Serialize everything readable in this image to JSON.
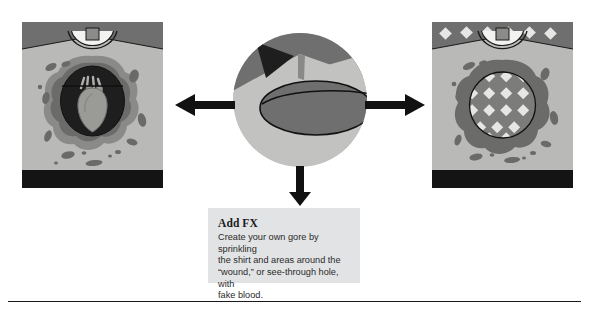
{
  "page": {
    "background_color": "#ffffff",
    "width": 589,
    "height": 311
  },
  "colors": {
    "shirt_body": "#b9bab8",
    "shoulder_band": "#6e6f6e",
    "collar_line": "#1a1a1a",
    "collar_white": "#f2f2f0",
    "hem_band": "#141414",
    "blood_outer": "#8a8b88",
    "blood_mid": "#6b6c69",
    "wound_dark": "#1e1e1e",
    "heart": "#9a9b97",
    "splatter": "#6a6b68",
    "diamond": "#e6e7e4",
    "hole_fill": "#7c7d7a",
    "caption_bg": "#e2e3e4",
    "arrow": "#111111",
    "rule": "#1a1a1a",
    "detail_circle_light": "#c2c3c1",
    "detail_circle_mid": "#8a8b88",
    "detail_circle_dark": "#6e6f6e",
    "detail_circle_black": "#1e1e1e"
  },
  "panels": {
    "left": {
      "name": "gore-wound-shirt",
      "description": "T-shirt with torn gore wound revealing a heart"
    },
    "right": {
      "name": "see-through-hole-shirt",
      "description": "T-shirt with see-through hole revealing diamond pattern fabric"
    }
  },
  "center": {
    "name": "magnified-detail",
    "description": "Magnified circular detail of the shirt wound"
  },
  "arrows": {
    "left": "arrow-left",
    "right": "arrow-right",
    "down": "arrow-down"
  },
  "caption": {
    "title": "Add FX",
    "body": "Create your own gore by sprinkling\nthe shirt and areas around the\n“wound,” or see-through hole, with\nfake blood."
  }
}
